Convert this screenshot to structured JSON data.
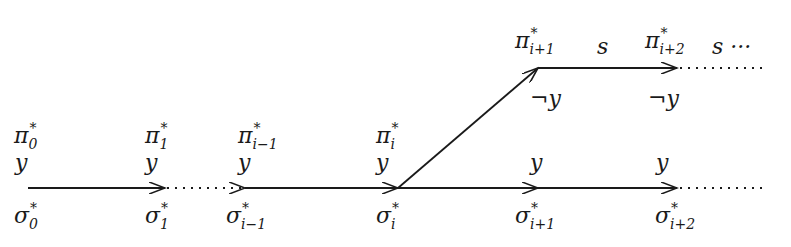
{
  "diagram": {
    "type": "branching-run-diagram",
    "bottom_row": {
      "nodes": [
        {
          "sym": "σ",
          "sup": "*",
          "sub": "0",
          "x": 28,
          "prop": "y",
          "pi_sym": "π",
          "pi_sub": "0"
        },
        {
          "sym": "σ",
          "sup": "*",
          "sub": "1",
          "x": 165,
          "prop": "y",
          "pi_sym": "π",
          "pi_sub": "1"
        },
        {
          "sym": "σ",
          "sup": "*",
          "sub": "i−1",
          "x": 245,
          "prop": "y",
          "pi_sym": "π",
          "pi_sub": "i−1"
        },
        {
          "sym": "σ",
          "sup": "*",
          "sub": "i",
          "x": 398,
          "prop": "y",
          "pi_sym": "π",
          "pi_sub": "i"
        },
        {
          "sym": "σ",
          "sup": "*",
          "sub": "i+1",
          "x": 538,
          "prop": "y"
        },
        {
          "sym": "σ",
          "sup": "*",
          "sub": "i+2",
          "x": 677,
          "prop": "y"
        }
      ],
      "edges": [
        {
          "from": 28,
          "to": 165,
          "style": "solid",
          "arrow": true
        },
        {
          "from": 165,
          "to": 245,
          "style": "dotted",
          "arrow": true
        },
        {
          "from": 245,
          "to": 398,
          "style": "solid",
          "arrow": true
        },
        {
          "from": 398,
          "to": 538,
          "style": "solid",
          "arrow": true
        },
        {
          "from": 538,
          "to": 677,
          "style": "solid",
          "arrow": true
        },
        {
          "from": 677,
          "to": 765,
          "style": "dotted",
          "arrow": false
        }
      ]
    },
    "top_row": {
      "nodes": [
        {
          "sym": "π",
          "sup": "*",
          "sub": "i+1",
          "x": 538,
          "prop": "¬y",
          "edge_label": "s"
        },
        {
          "sym": "π",
          "sup": "*",
          "sub": "i+2",
          "x": 677,
          "prop": "¬y",
          "edge_label": "s ···"
        }
      ],
      "branch_edge": {
        "from": [
          398,
          188
        ],
        "to": [
          538,
          68
        ],
        "style": "solid",
        "arrow": true
      },
      "edges": [
        {
          "from": 538,
          "to": 677,
          "style": "solid",
          "arrow": true
        },
        {
          "from": 677,
          "to": 765,
          "style": "dotted",
          "arrow": false
        }
      ]
    },
    "labels": {
      "pi0": {
        "sym": "π",
        "sup": "*",
        "sub": "0"
      },
      "pi1": {
        "sym": "π",
        "sup": "*",
        "sub": "1"
      },
      "pim1": {
        "sym": "π",
        "sup": "*",
        "sub": "i−1"
      },
      "pii": {
        "sym": "π",
        "sup": "*",
        "sub": "i"
      },
      "pii1": {
        "sym": "π",
        "sup": "*",
        "sub": "i+1"
      },
      "pii2": {
        "sym": "π",
        "sup": "*",
        "sub": "i+2"
      },
      "s1": "s",
      "s2": "s ···",
      "y": "y",
      "noty": "¬y",
      "sig0": {
        "sym": "σ",
        "sup": "*",
        "sub": "0"
      },
      "sig1": {
        "sym": "σ",
        "sup": "*",
        "sub": "1"
      },
      "sigm1": {
        "sym": "σ",
        "sup": "*",
        "sub": "i−1"
      },
      "sigi": {
        "sym": "σ",
        "sup": "*",
        "sub": "i"
      },
      "sigi1": {
        "sym": "σ",
        "sup": "*",
        "sub": "i+1"
      },
      "sigi2": {
        "sym": "σ",
        "sup": "*",
        "sub": "i+2"
      }
    },
    "colors": {
      "ink": "#1a1a1a",
      "background": "#ffffff"
    }
  }
}
